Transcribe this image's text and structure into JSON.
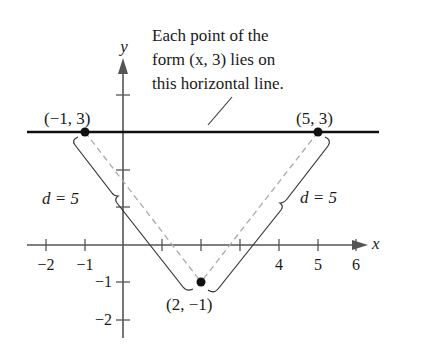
{
  "annotation": {
    "lines": [
      "Each point of the",
      "form (x, 3) lies on",
      "this horizontal line."
    ]
  },
  "axes": {
    "x_label": "x",
    "y_label": "y",
    "x_ticks": [
      "−2",
      "−1",
      "4",
      "5",
      "6"
    ],
    "y_ticks": [
      "−1",
      "−2"
    ]
  },
  "points": [
    {
      "label": "(−1, 3)",
      "x": -1,
      "y": 3
    },
    {
      "label": "(5, 3)",
      "x": 5,
      "y": 3
    },
    {
      "label": "(2, −1)",
      "x": 2,
      "y": -1
    }
  ],
  "distances": [
    {
      "label": "d = 5",
      "from": "(2, −1)",
      "to": "(−1, 3)"
    },
    {
      "label": "d = 5",
      "from": "(2, −1)",
      "to": "(5, 3)"
    }
  ],
  "horizontal_line": {
    "equation": "y = 3"
  },
  "colors": {
    "ink": "#1a1a1a",
    "axis": "#555555",
    "dashed": "#aaaaaa"
  }
}
